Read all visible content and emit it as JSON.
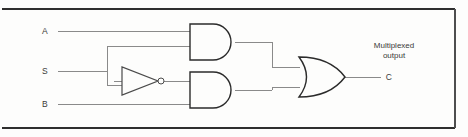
{
  "figure": {
    "background_color": "#fdfdfc",
    "line_color": "#8a8a8a",
    "gate_outline_color": "#2b2b2b",
    "text_color": "#3a3a3a"
  },
  "inputs": [
    {
      "id": "a",
      "label": "A",
      "x": 48,
      "y": 31
    },
    {
      "id": "s",
      "label": "S",
      "x": 48,
      "y": 71
    },
    {
      "id": "b",
      "label": "B",
      "x": 48,
      "y": 104
    }
  ],
  "output": {
    "id": "c",
    "label": "C",
    "caption_line1": "Multiplexed",
    "caption_line2": "output",
    "x": 388,
    "y": 74
  },
  "gates": [
    {
      "id": "and-top",
      "type": "AND",
      "label": "AND",
      "x": 190,
      "y": 24,
      "width": 45,
      "height": 36
    },
    {
      "id": "not-s",
      "type": "NOT",
      "label": "NOT",
      "x": 122,
      "y": 67,
      "width": 34,
      "height": 28
    },
    {
      "id": "and-bottom",
      "type": "AND",
      "label": "AND",
      "x": 190,
      "y": 72,
      "width": 45,
      "height": 36
    },
    {
      "id": "or-out",
      "type": "OR",
      "label": "OR",
      "x": 297,
      "y": 57,
      "width": 48,
      "height": 40
    }
  ],
  "nets": [
    {
      "id": "net-a",
      "from": "A",
      "to": "and-top.in1"
    },
    {
      "id": "net-s",
      "from": "S",
      "to": "and-top.in2"
    },
    {
      "id": "net-s-inv",
      "from": "S",
      "to": "not-s.in"
    },
    {
      "id": "net-nots",
      "from": "not-s.out",
      "to": "and-bottom.in1"
    },
    {
      "id": "net-b",
      "from": "B",
      "to": "and-bottom.in2"
    },
    {
      "id": "net-and-top-out",
      "from": "and-top.out",
      "to": "or-out.in1"
    },
    {
      "id": "net-and-bottom-out",
      "from": "and-bottom.out",
      "to": "or-out.in2"
    },
    {
      "id": "net-out",
      "from": "or-out.out",
      "to": "C"
    }
  ]
}
